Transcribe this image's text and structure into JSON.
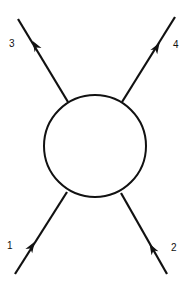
{
  "diagram": {
    "type": "scattering-vertex",
    "colors": {
      "stroke": "#111111",
      "background": "#ffffff",
      "blob_fill": "#ffffff"
    },
    "blob": {
      "cx": 95,
      "cy": 146,
      "r": 51
    },
    "legs": [
      {
        "id": "1",
        "label": "1",
        "direction": "incoming",
        "outer": [
          15,
          274
        ],
        "inner": [
          67,
          192
        ],
        "arrow_at": [
          32,
          246
        ],
        "label_pos": [
          7,
          249
        ]
      },
      {
        "id": "2",
        "label": "2",
        "direction": "incoming",
        "outer": [
          167,
          274
        ],
        "inner": [
          121,
          193
        ],
        "arrow_at": [
          152,
          248
        ],
        "label_pos": [
          171,
          251
        ]
      },
      {
        "id": "3",
        "label": "3",
        "direction": "outgoing",
        "outer": [
          18,
          19
        ],
        "inner": [
          68,
          102
        ],
        "arrow_at": [
          35,
          45
        ],
        "label_pos": [
          9,
          47
        ]
      },
      {
        "id": "4",
        "label": "4",
        "direction": "outgoing",
        "outer": [
          175,
          17
        ],
        "inner": [
          122,
          102
        ],
        "arrow_at": [
          157,
          47
        ],
        "label_pos": [
          173,
          48
        ]
      }
    ]
  }
}
